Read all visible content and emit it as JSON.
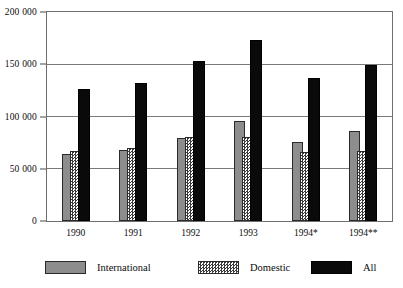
{
  "chart_data": {
    "type": "bar",
    "title": "",
    "subtitle": "",
    "xlabel": "",
    "ylabel": "",
    "categories": [
      "1990",
      "1991",
      "1992",
      "1993",
      "1994*",
      "1994**"
    ],
    "series": [
      {
        "name": "International",
        "values": [
          64000,
          68000,
          79000,
          96000,
          76000,
          86000
        ],
        "color": "#8d8d8d",
        "pattern": "solid-gray"
      },
      {
        "name": "Domestic",
        "values": [
          67000,
          70000,
          80000,
          80000,
          66000,
          67000
        ],
        "color": "#3a3a3a",
        "pattern": "checkerboard"
      },
      {
        "name": "All",
        "values": [
          126000,
          132000,
          153000,
          173000,
          137000,
          149000
        ],
        "color": "#0a0a0a",
        "pattern": "solid-black"
      }
    ],
    "ylim": [
      0,
      200000
    ],
    "yticks": [
      0,
      50000,
      100000,
      150000,
      200000
    ],
    "ytick_labels": [
      "0",
      "50 000",
      "100 000",
      "150 000",
      "200 000"
    ],
    "grid": true,
    "grid_axis": "y",
    "legend_position": "bottom",
    "bar_overlap": true
  },
  "legend": {
    "items": [
      {
        "label": "International",
        "swatch": "solid-gray-swatch"
      },
      {
        "label": "Domestic",
        "swatch": "checkerboard-swatch"
      },
      {
        "label": "All",
        "swatch": "solid-black-swatch"
      }
    ]
  }
}
